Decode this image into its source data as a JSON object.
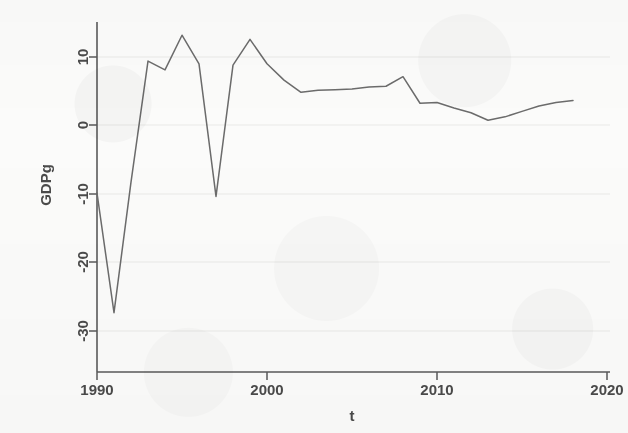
{
  "figure": {
    "background_color": "#fbfbfa",
    "line_color": "#6b6b6b",
    "axis_color": "#5a5a5a",
    "grid_color": "#e9e9e7",
    "text_color": "#4a4a4a"
  },
  "chart_data": {
    "type": "line",
    "title": "",
    "subtitle": "",
    "xlabel": "t",
    "ylabel": "GDPg",
    "xlim": [
      1989.0,
      2021.2
    ],
    "ylim": [
      -32.5,
      15.2
    ],
    "xticks": [
      1990,
      2000,
      2010,
      2020
    ],
    "xtick_labels": [
      "1990",
      "2000",
      "2010",
      "2020"
    ],
    "yticks": [
      10,
      0,
      -10,
      -20,
      -30
    ],
    "ytick_labels": [
      "10",
      "0",
      "-10",
      "-20",
      "-30"
    ],
    "grid": "horizontal-faint",
    "legend": "none",
    "series": [
      {
        "name": "GDPg",
        "x": [
          1990,
          1991,
          1992,
          1993,
          1994,
          1995,
          1996,
          1997,
          1998,
          1999,
          2000,
          2001,
          2002,
          2003,
          2004,
          2005,
          2006,
          2007,
          2008,
          2009,
          2010,
          2011,
          2012,
          2013,
          2014,
          2015,
          2016,
          2017,
          2018
        ],
        "values": [
          -10.0,
          -27.6,
          -8.4,
          9.4,
          8.1,
          13.2,
          9.0,
          -10.5,
          8.8,
          12.6,
          9.0,
          6.6,
          4.8,
          5.1,
          5.2,
          5.3,
          5.6,
          5.7,
          7.1,
          3.2,
          3.3,
          2.5,
          1.8,
          0.7,
          1.2,
          2.0,
          2.8,
          3.3,
          3.6
        ]
      }
    ]
  },
  "axis": {
    "y_title": "GDPg",
    "x_title": "t"
  }
}
